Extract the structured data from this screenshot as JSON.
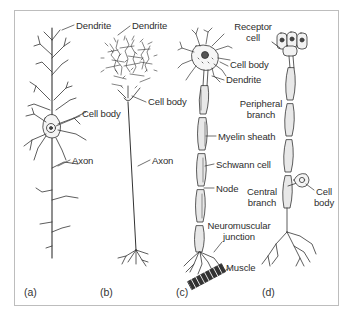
{
  "figure": {
    "panels": [
      {
        "id": "a",
        "label": "(a)",
        "annotations": {
          "dendrite": "Dendrite",
          "cell_body": "Cell body",
          "axon": "Axon"
        }
      },
      {
        "id": "b",
        "label": "(b)",
        "annotations": {
          "dendrite": "Dendrite",
          "cell_body": "Cell body",
          "axon": "Axon"
        }
      },
      {
        "id": "c",
        "label": "(c)",
        "annotations": {
          "cell_body": "Cell body",
          "dendrite": "Dendrite",
          "myelin_sheath": "Myelin sheath",
          "schwann_cell": "Schwann cell",
          "node": "Node",
          "neuromuscular_line1": "Neuromuscular",
          "neuromuscular_line2": "junction",
          "muscle": "Muscle"
        }
      },
      {
        "id": "d",
        "label": "(d)",
        "annotations": {
          "receptor_line1": "Receptor",
          "receptor_line2": "cell",
          "peripheral_line1": "Peripheral",
          "peripheral_line2": "branch",
          "central_line1": "Central",
          "central_line2": "branch",
          "cell_body_line1": "Cell",
          "cell_body_line2": "body"
        }
      }
    ],
    "colors": {
      "ink": "#2d2d2d",
      "frame": "#bdbdbd",
      "background": "#ffffff"
    }
  }
}
